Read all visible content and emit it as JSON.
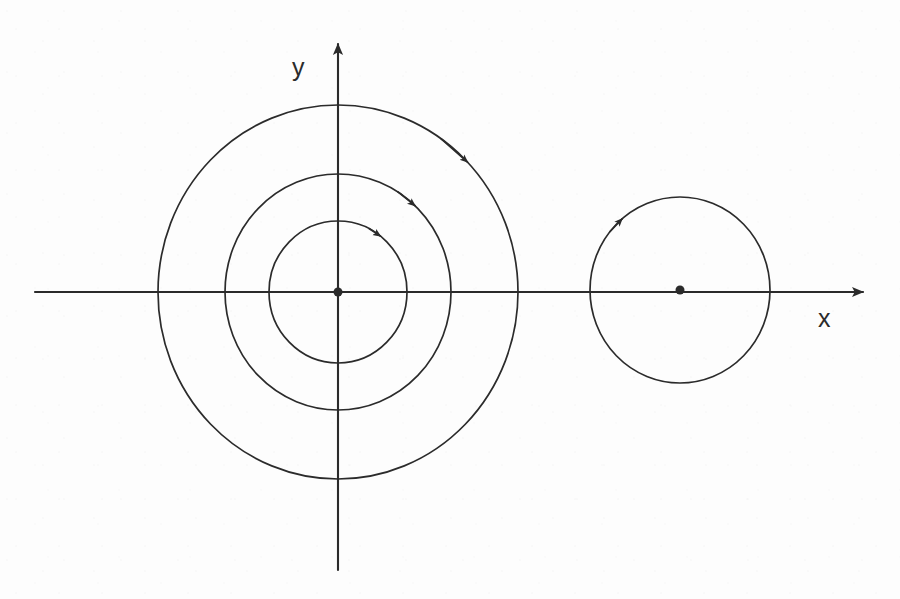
{
  "figure": {
    "background_color": "#fdfdfd",
    "ink_color": "#2b2b2b",
    "width": 900,
    "height": 599
  },
  "axes": {
    "x_axis": {
      "label": "x",
      "label_x": 818,
      "label_y": 327,
      "start_x": 35,
      "end_x": 877,
      "y": 292,
      "arrow": "right"
    },
    "y_axis": {
      "label": "y",
      "label_x": 292,
      "label_y": 76,
      "x": 338,
      "start_y": 570,
      "end_y": 30,
      "arrow": "up"
    }
  },
  "origin_marker": {
    "name": "origin-dot",
    "cx": 338,
    "cy": 292,
    "r": 4.5
  },
  "chart_data": {
    "type": "scatter",
    "title": "",
    "xlabel": "x",
    "ylabel": "y",
    "grid": false,
    "legend": null,
    "fixed_points": [
      {
        "name": "origin-center",
        "x": 338,
        "y": 292,
        "type": "center"
      },
      {
        "name": "right-center",
        "x": 680,
        "y": 290,
        "type": "center"
      }
    ],
    "orbits": [
      {
        "name": "inner-orbit",
        "center": [
          338,
          292
        ],
        "rx": 69,
        "ry": 71,
        "direction": "counterclockwise",
        "arrow_angle_deg": 52,
        "arrow_x": 392,
        "arrow_y": 250
      },
      {
        "name": "middle-orbit",
        "center": [
          338,
          292
        ],
        "rx": 113,
        "ry": 118,
        "direction": "counterclockwise",
        "arrow_angle_deg": 47,
        "arrow_x": 423,
        "arrow_y": 206
      },
      {
        "name": "outer-orbit",
        "center": [
          338,
          292
        ],
        "rx": 180,
        "ry": 187,
        "direction": "counterclockwise",
        "arrow_angle_deg": 44,
        "arrow_x": 463,
        "arrow_y": 151
      },
      {
        "name": "right-orbit",
        "center": [
          680,
          290
        ],
        "rx": 90,
        "ry": 93,
        "direction": "counterclockwise",
        "arrow_angle_deg": 130,
        "arrow_x": 622,
        "arrow_y": 220
      }
    ]
  }
}
